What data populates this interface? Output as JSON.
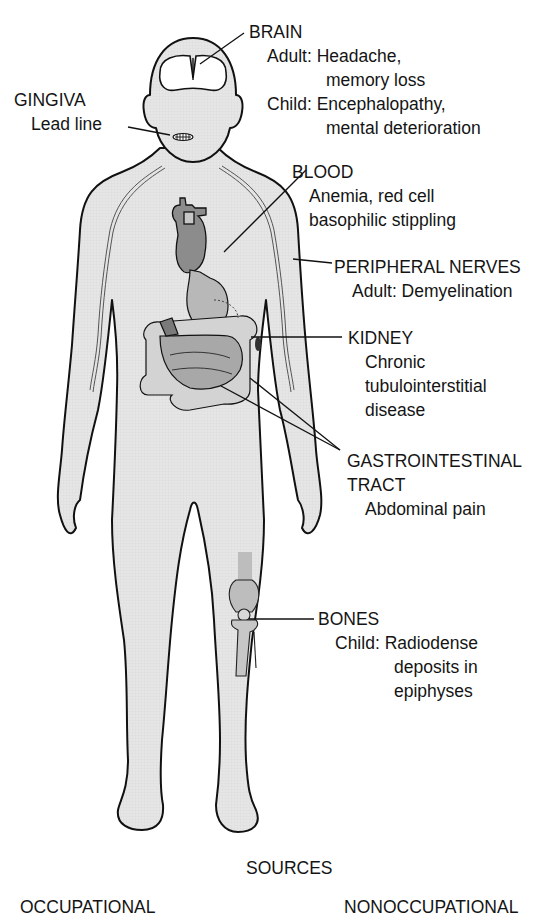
{
  "diagram": {
    "colors": {
      "skin_fill": "#e3e3e3",
      "organ_dark": "#8a8a8a",
      "organ_mid": "#a8a8a8",
      "organ_light": "#cbcbcb",
      "outline": "#111111",
      "background": "#ffffff"
    },
    "labels": {
      "brain": {
        "title": "BRAIN",
        "lines": [
          {
            "prefix": "Adult:",
            "text": "Headache,"
          },
          {
            "prefix": "",
            "text": "memory loss"
          },
          {
            "prefix": "Child:",
            "text": "Encephalopathy,"
          },
          {
            "prefix": "",
            "text": "mental deterioration"
          }
        ]
      },
      "gingiva": {
        "title": "GINGIVA",
        "lines": [
          "Lead line"
        ]
      },
      "blood": {
        "title": "BLOOD",
        "lines": [
          "Anemia, red cell",
          "basophilic stippling"
        ]
      },
      "peripheral_nerves": {
        "title": "PERIPHERAL NERVES",
        "lines": [
          "Adult: Demyelination"
        ]
      },
      "kidney": {
        "title": "KIDNEY",
        "lines": [
          "Chronic",
          "tubulointerstitial",
          "disease"
        ]
      },
      "gastrointestinal": {
        "title_lines": [
          "GASTROINTESTINAL",
          "TRACT"
        ],
        "lines": [
          "Abdominal pain"
        ]
      },
      "bones": {
        "title": "BONES",
        "lines": [
          {
            "prefix": "Child:",
            "text": "Radiodense"
          },
          {
            "prefix": "",
            "text": "deposits in"
          },
          {
            "prefix": "",
            "text": "epiphyses"
          }
        ]
      }
    },
    "footer": {
      "sources": "SOURCES",
      "occupational": "OCCUPATIONAL",
      "nonoccupational": "NONOCCUPATIONAL"
    }
  }
}
